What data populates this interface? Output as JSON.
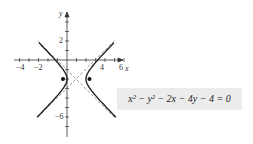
{
  "chart_data": {
    "type": "line",
    "title": "",
    "xlabel": "x",
    "ylabel": "y",
    "xticks": [
      -4,
      -2,
      2,
      4,
      6
    ],
    "xtick_labels": [
      "-4",
      "-2",
      "4",
      "6"
    ],
    "yticks": [
      2,
      -6
    ],
    "equation": "x² − y² − 2x − 4y − 4 = 0",
    "curve": "hyperbola (x-1)^2 - (y+2)^2 = 1",
    "center": [
      1,
      -2
    ],
    "vertices": [
      [
        0,
        -2
      ],
      [
        2,
        -2
      ]
    ],
    "foci": [
      [
        -0.414,
        -2
      ],
      [
        2.414,
        -2
      ]
    ],
    "asymptotes": [
      "y + 2 = x - 1",
      "y + 2 = -(x - 1)"
    ],
    "xlim": [
      -5,
      7
    ],
    "ylim": [
      -8,
      5
    ]
  },
  "labels": {
    "x": "x",
    "y": "y",
    "equation": "x² − y² − 2x − 4y − 4 = 0"
  }
}
